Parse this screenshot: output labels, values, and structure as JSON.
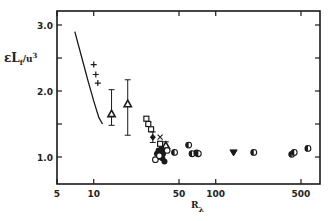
{
  "chart_data": {
    "type": "scatter",
    "title": "",
    "xlabel": "R",
    "xlabel_subscript": "λ",
    "ylabel": "εL",
    "ylabel_subscript": "f",
    "ylabel_suffix": "/u",
    "ylabel_superscript": "3",
    "xscale": "log",
    "yscale": "linear",
    "xlim": [
      5,
      700
    ],
    "ylim": [
      0.65,
      3.2
    ],
    "grid": false,
    "legend": "none",
    "x_ticks": [
      {
        "value": 5,
        "label": "5"
      },
      {
        "value": 10,
        "label": "10"
      },
      {
        "value": 50,
        "label": "50"
      },
      {
        "value": 100,
        "label": "100"
      },
      {
        "value": 500,
        "label": "500"
      }
    ],
    "y_ticks": [
      {
        "value": 1.0,
        "label": "1.0"
      },
      {
        "value": 1.5,
        "label": ""
      },
      {
        "value": 2.0,
        "label": "2.0"
      },
      {
        "value": 2.5,
        "label": ""
      },
      {
        "value": 3.0,
        "label": "3.0"
      }
    ],
    "series": [
      {
        "name": "curve",
        "marker": "line",
        "points": [
          [
            7.0,
            2.9
          ],
          [
            8.0,
            2.5
          ],
          [
            9.0,
            2.15
          ],
          [
            10.0,
            1.85
          ],
          [
            11.0,
            1.6
          ],
          [
            11.8,
            1.5
          ]
        ]
      },
      {
        "name": "plus",
        "marker": "plus",
        "points": [
          [
            10.0,
            2.4
          ],
          [
            10.4,
            2.25
          ],
          [
            10.8,
            2.12
          ]
        ]
      },
      {
        "name": "triangle-errorbar",
        "marker": "triangle-up",
        "points": [
          [
            14.0,
            1.65,
            1.48,
            2.02
          ],
          [
            19.0,
            1.8,
            1.33,
            2.17
          ]
        ]
      },
      {
        "name": "square",
        "marker": "square",
        "points": [
          [
            27.0,
            1.58
          ],
          [
            28.0,
            1.5
          ],
          [
            29.5,
            1.42
          ],
          [
            35.0,
            1.2
          ]
        ]
      },
      {
        "name": "cross",
        "marker": "x",
        "points": [
          [
            35.0,
            1.3
          ]
        ]
      },
      {
        "name": "filled-diamond-errorbar",
        "marker": "diamond",
        "points": [
          [
            30.5,
            1.3,
            1.22,
            1.38
          ]
        ]
      },
      {
        "name": "triangle-small-errorbar",
        "marker": "triangle-up",
        "points": [
          [
            39.0,
            1.17,
            1.08,
            1.23
          ]
        ]
      },
      {
        "name": "filled-circle",
        "marker": "filled-circle",
        "points": [
          [
            33.0,
            1.05
          ],
          [
            34.0,
            1.1
          ],
          [
            34.5,
            1.0
          ],
          [
            36.0,
            1.12
          ],
          [
            36.5,
            0.98
          ],
          [
            37.0,
            1.05
          ],
          [
            38.0,
            0.93
          ],
          [
            35.5,
            1.07
          ]
        ]
      },
      {
        "name": "open-circle",
        "marker": "open-circle",
        "points": [
          [
            32.0,
            0.96
          ],
          [
            34.5,
            1.02
          ],
          [
            40.0,
            1.1
          ]
        ]
      },
      {
        "name": "half-filled-circle",
        "marker": "half-circle",
        "points": [
          [
            46.0,
            1.07
          ],
          [
            60.0,
            1.18
          ],
          [
            64.0,
            1.05
          ],
          [
            70.0,
            1.06
          ],
          [
            72.0,
            1.05
          ],
          [
            205.0,
            1.07
          ],
          [
            420.0,
            1.04
          ],
          [
            440.0,
            1.07
          ],
          [
            570.0,
            1.13
          ]
        ]
      },
      {
        "name": "inverted-triangle",
        "marker": "triangle-down",
        "points": [
          [
            140.0,
            1.07
          ]
        ]
      }
    ]
  }
}
